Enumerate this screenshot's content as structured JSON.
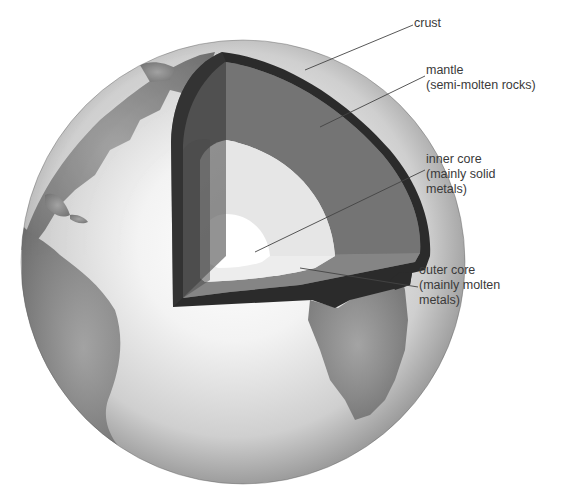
{
  "diagram": {
    "colors": {
      "background": "#ffffff",
      "ocean_light": "#f2f2f2",
      "ocean_shade": "#9a9a9a",
      "land": "#7c7c7c",
      "crust": "#2b2b2b",
      "mantle": "#6a6a6a",
      "outer_core": "#dcdcdc",
      "inner_core": "#ffffff",
      "leader_line": "#444444",
      "label_text": "#3a3a3a"
    },
    "labels": [
      {
        "id": "crust",
        "lines": [
          "crust"
        ]
      },
      {
        "id": "mantle",
        "lines": [
          "mantle",
          "(semi-molten rocks)"
        ]
      },
      {
        "id": "inner-core",
        "lines": [
          "inner core",
          "(mainly solid",
          "metals)"
        ]
      },
      {
        "id": "outer-core",
        "lines": [
          "outer core",
          "(mainly molten",
          "metals)"
        ]
      }
    ]
  }
}
